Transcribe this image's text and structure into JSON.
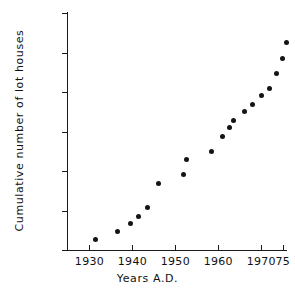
{
  "chart_data": {
    "type": "scatter",
    "title": "",
    "xlabel": "Years A.D.",
    "ylabel": "Cumulative number of lot houses",
    "xlim": [
      1925,
      1976
    ],
    "ylim": [
      0,
      300
    ],
    "grid": false,
    "legend": null,
    "xtick_labels": [
      "1930",
      "1940",
      "1950",
      "1960",
      "1970",
      "75"
    ],
    "xtick_values": [
      1930,
      1940,
      1950,
      1960,
      1970,
      1975
    ],
    "ytick_labels": [
      "0",
      "50",
      "100",
      "150",
      "200",
      "250",
      "300"
    ],
    "ytick_values": [
      0,
      50,
      100,
      150,
      200,
      250,
      300
    ],
    "marker": "filled-circle",
    "marker_color": "#141414",
    "x": [
      1931.5,
      1936.5,
      1939.5,
      1941.5,
      1943.5,
      1946,
      1952,
      1952.5,
      1958.5,
      1961,
      1962.5,
      1963.5,
      1966,
      1968,
      1970,
      1972,
      1973.5,
      1975
    ],
    "y": [
      13,
      24,
      34,
      43,
      54,
      84,
      95,
      114,
      125,
      144,
      155,
      164,
      175,
      184,
      195,
      204,
      223,
      243
    ],
    "points": [
      {
        "x": 1931.5,
        "y": 13
      },
      {
        "x": 1936.5,
        "y": 24
      },
      {
        "x": 1939.5,
        "y": 34
      },
      {
        "x": 1941.5,
        "y": 43
      },
      {
        "x": 1943.5,
        "y": 54
      },
      {
        "x": 1946.0,
        "y": 84
      },
      {
        "x": 1952.0,
        "y": 95
      },
      {
        "x": 1952.5,
        "y": 114
      },
      {
        "x": 1958.5,
        "y": 125
      },
      {
        "x": 1961.0,
        "y": 144
      },
      {
        "x": 1962.5,
        "y": 155
      },
      {
        "x": 1963.5,
        "y": 164
      },
      {
        "x": 1966.0,
        "y": 175
      },
      {
        "x": 1968.0,
        "y": 184
      },
      {
        "x": 1970.0,
        "y": 195
      },
      {
        "x": 1972.0,
        "y": 204
      },
      {
        "x": 1973.5,
        "y": 223
      },
      {
        "x": 1975.0,
        "y": 243
      },
      {
        "x": 1975.8,
        "y": 263
      }
    ]
  }
}
